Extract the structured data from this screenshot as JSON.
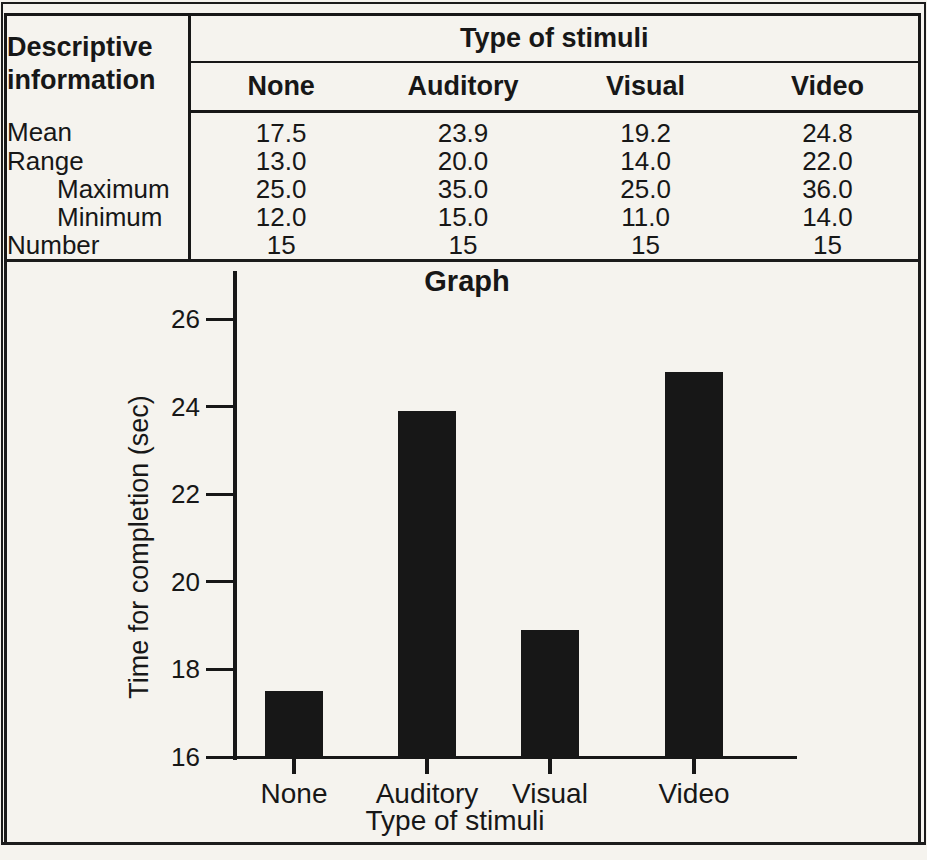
{
  "table": {
    "corner_header": [
      "Descriptive",
      "information"
    ],
    "group_header": "Type of stimuli",
    "columns": [
      "None",
      "Auditory",
      "Visual",
      "Video"
    ],
    "rows": [
      {
        "label": "Mean",
        "indent": false,
        "values": [
          "17.5",
          "23.9",
          "19.2",
          "24.8"
        ]
      },
      {
        "label": "Range",
        "indent": false,
        "values": [
          "13.0",
          "20.0",
          "14.0",
          "22.0"
        ]
      },
      {
        "label": "Maximum",
        "indent": true,
        "values": [
          "25.0",
          "35.0",
          "25.0",
          "36.0"
        ]
      },
      {
        "label": "Minimum",
        "indent": true,
        "values": [
          "12.0",
          "15.0",
          "11.0",
          "14.0"
        ]
      },
      {
        "label": "Number",
        "indent": false,
        "values": [
          "15",
          "15",
          "15",
          "15"
        ]
      }
    ]
  },
  "chart_data": {
    "type": "bar",
    "title": "Graph",
    "categories": [
      "None",
      "Auditory",
      "Visual",
      "Video"
    ],
    "values": [
      17.5,
      23.9,
      18.9,
      24.8
    ],
    "xlabel": "Type of stimuli",
    "ylabel": "Time for completion (sec)",
    "ylim": [
      16,
      26
    ],
    "yticks": [
      16,
      18,
      20,
      22,
      24,
      26
    ],
    "grid": false,
    "legend": false,
    "bar_color": "#171717"
  },
  "colors": {
    "ink": "#171717",
    "paper": "#f5f3ee"
  }
}
